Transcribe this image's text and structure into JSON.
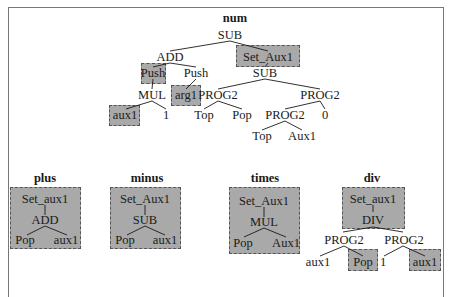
{
  "diagram": {
    "colors": {
      "highlight_box": "#a9a9a9",
      "box_border": "#555555",
      "edge": "#1a1a1a",
      "frame": "#777777"
    },
    "num": {
      "title": "num",
      "nodes": {
        "root": "SUB",
        "add": "ADD",
        "set_aux1": "Set_Aux1",
        "push_left": "Push",
        "push_right": "Push",
        "sub_right": "SUB",
        "mul": "MUL",
        "arg1": "arg1",
        "prog2_a": "PROG2",
        "prog2_b": "PROG2",
        "aux1": "aux1",
        "one": "1",
        "top_a": "Top",
        "pop_a": "Pop",
        "prog2_c": "PROG2",
        "zero": "0",
        "top_b": "Top",
        "aux1_b": "Aux1"
      }
    },
    "plus": {
      "title": "plus",
      "nodes": {
        "set": "Set_aux1",
        "op": "ADD",
        "left": "Pop",
        "right": "aux1"
      }
    },
    "minus": {
      "title": "minus",
      "nodes": {
        "set": "Set_Aux1",
        "op": "SUB",
        "left": "Pop",
        "right": "aux1"
      }
    },
    "times": {
      "title": "times",
      "nodes": {
        "set": "Set_Aux1",
        "op": "MUL",
        "left": "Pop",
        "right": "Aux1"
      }
    },
    "div": {
      "title": "div",
      "nodes": {
        "set": "Set_aux1",
        "op": "DIV",
        "prog2_left": "PROG2",
        "prog2_right": "PROG2",
        "ll": "aux1",
        "lr": "Pop",
        "rl": "1",
        "rr": "aux1"
      }
    }
  }
}
